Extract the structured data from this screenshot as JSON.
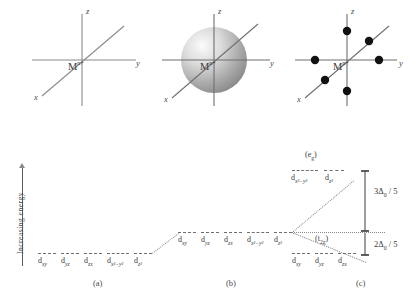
{
  "figure": {
    "ion_label": "M",
    "ion_charge": "n+",
    "axis_x": "x",
    "axis_y": "y",
    "axis_z": "z",
    "captions": [
      "(a)",
      "(b)",
      "(c)"
    ],
    "y_axis_label": "Increasing energy"
  },
  "orbitals": {
    "xy": "d",
    "xy_sub": "xy",
    "yz": "d",
    "yz_sub": "yz",
    "zx": "d",
    "zx_sub": "zx",
    "x2y2": "d",
    "x2y2_sub": "x²−y²",
    "z2": "d",
    "z2_sub": "z²"
  },
  "free_ion_level": {
    "labels": [
      "d",
      "d",
      "d",
      "d",
      "d"
    ],
    "subs": [
      "xy",
      "yz",
      "zx",
      "x²−y²",
      "z²"
    ],
    "count": 5
  },
  "spherical_level": {
    "labels": [
      "d",
      "d",
      "d",
      "d",
      "d"
    ],
    "subs": [
      "xy",
      "yz",
      "zx",
      "x²−y²",
      "z²"
    ],
    "count": 5
  },
  "octahedral": {
    "eg_term": "(e",
    "eg_term_sub": "g",
    "eg_term_close": ")",
    "eg_labels": [
      "d",
      "d"
    ],
    "eg_subs": [
      "x²−y²",
      "z²"
    ],
    "t2g_term": "(t",
    "t2g_term_sub": "2g",
    "t2g_term_close": ")",
    "t2g_labels": [
      "d",
      "d",
      "d"
    ],
    "t2g_subs": [
      "xy",
      "yz",
      "zx"
    ],
    "split_upper": "3Δ",
    "split_upper_sub": "0",
    "split_upper_tail": " / 5",
    "split_lower": "2Δ",
    "split_lower_sub": "0",
    "split_lower_tail": " / 5"
  },
  "colors": {
    "line": "#8a8a8a",
    "dark_line": "#5a5a5a",
    "level": "#6e6e6e",
    "ligand_dot": "#111111",
    "sphere_light": "#f2f2f2",
    "sphere_dark": "#8e8e8e",
    "text": "#3a3a3a"
  }
}
